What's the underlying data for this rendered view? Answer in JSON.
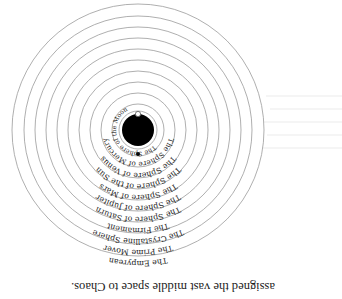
{
  "figure": {
    "orientation_degrees": 180,
    "center_earth_color": "#000000",
    "ring_color": "#9a9a9a",
    "spheres": [
      {
        "label": "The Sphere of the Moon"
      },
      {
        "label": "The Sphere of Mercury"
      },
      {
        "label": "The Sphere of Venus"
      },
      {
        "label": "The Sphere of the Sun"
      },
      {
        "label": "The Sphere of Mars"
      },
      {
        "label": "The Sphere of Jupiter"
      },
      {
        "label": "The Sphere of Saturn"
      },
      {
        "label": "The Firmament"
      },
      {
        "label": "The Crystalline Sphere"
      },
      {
        "label": "The Prime Mover"
      },
      {
        "label": "The Empyrean"
      }
    ]
  },
  "text": {
    "caption": "assigned the vast middle space to Chaos."
  }
}
